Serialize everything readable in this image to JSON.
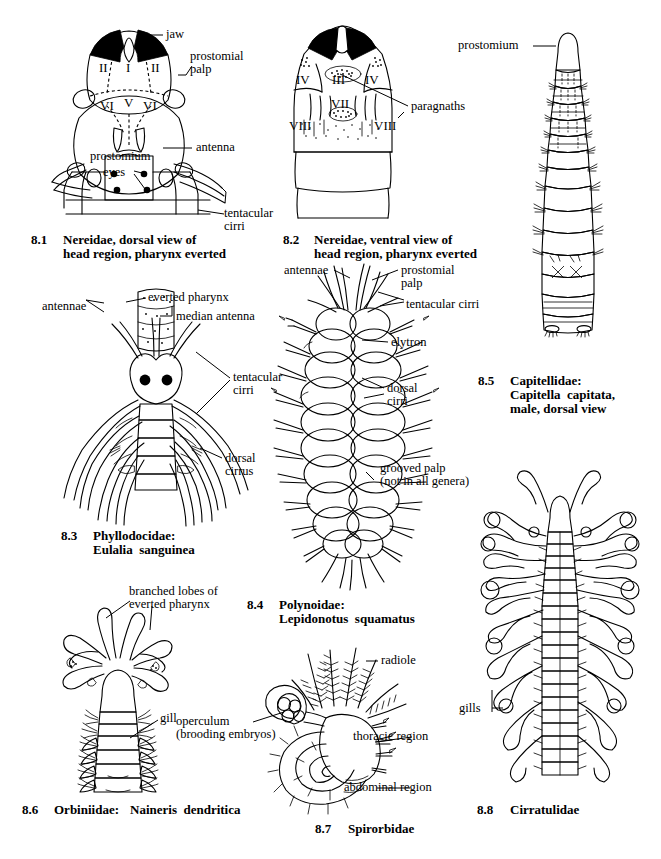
{
  "page": {
    "header_faint": "",
    "width": 661,
    "height": 859,
    "background": "#ffffff",
    "ink": "#000000"
  },
  "figures": [
    {
      "id": "8.1",
      "number": "8.1",
      "caption_line1": "Nereidae, dorsal view of",
      "caption_line2": "head region, pharynx everted",
      "taxon": "Nereidae",
      "italic_name": "",
      "labels": [
        {
          "name": "jaw",
          "text": "jaw"
        },
        {
          "name": "prostomial-palp",
          "text": "prostomial\npalp"
        },
        {
          "name": "antenna",
          "text": "antenna"
        },
        {
          "name": "prostomium",
          "text": "prostomium"
        },
        {
          "name": "eyes",
          "text": "eyes"
        },
        {
          "name": "tentacular-cirri",
          "text": "tentacular\ncirri"
        }
      ],
      "region_numerals": [
        "II",
        "I",
        "II",
        "VI",
        "V",
        "VI"
      ]
    },
    {
      "id": "8.2",
      "number": "8.2",
      "caption_line1": "Nereidae, ventral view of",
      "caption_line2": "head region, pharynx everted",
      "taxon": "Nereidae",
      "italic_name": "",
      "labels": [
        {
          "name": "paragnaths",
          "text": "paragnaths"
        }
      ],
      "region_numerals": [
        "IV",
        "III",
        "IV",
        "VII",
        "VIII",
        "VIII"
      ]
    },
    {
      "id": "8.3",
      "number": "8.3",
      "caption_line1": "Phyllodocidae:",
      "caption_line2": "Eulalia sanguinea",
      "taxon": "Phyllodocidae:",
      "italic_name": "Eulalia sanguinea",
      "labels": [
        {
          "name": "everted-pharynx",
          "text": "everted pharynx"
        },
        {
          "name": "median-antenna",
          "text": "median antenna"
        },
        {
          "name": "antennae",
          "text": "antennae"
        },
        {
          "name": "tentacular-cirri",
          "text": "tentacular\ncirri"
        },
        {
          "name": "dorsal-cirrus",
          "text": "dorsal\ncirrus"
        }
      ]
    },
    {
      "id": "8.4",
      "number": "8.4",
      "caption_line1": "Polynoidae:",
      "caption_line2": "Lepidonotus  squamatus",
      "taxon": "Polynoidae:",
      "italic_name": "Lepidonotus  squamatus",
      "labels": [
        {
          "name": "antennae",
          "text": "antennae"
        },
        {
          "name": "prostomial-palp",
          "text": "prostomial\npalp"
        },
        {
          "name": "tentacular-cirri",
          "text": "tentacular cirri"
        },
        {
          "name": "elytron",
          "text": "elytron"
        },
        {
          "name": "dorsal-cirri",
          "text": "dorsal\ncirri"
        },
        {
          "name": "grooved-palp",
          "text": "grooved palp\n(not in all genera)"
        }
      ]
    },
    {
      "id": "8.5",
      "number": "8.5",
      "caption_line1": "Capitellidae:",
      "caption_line2": "Capitella capitata,",
      "caption_line3": "male, dorsal view",
      "taxon": "Capitellidae:",
      "italic_name": "Capitella  capitata,",
      "labels": [
        {
          "name": "prostomium",
          "text": "prostomium"
        }
      ]
    },
    {
      "id": "8.6",
      "number": "8.6",
      "caption_line1": "Orbiniidae: Naineris dendritica",
      "taxon": "Orbiniidae:",
      "italic_name": "Naineris  dendritica",
      "labels": [
        {
          "name": "branched-lobes",
          "text": "branched lobes of\neverted pharynx"
        },
        {
          "name": "gill",
          "text": "gill"
        }
      ]
    },
    {
      "id": "8.7",
      "number": "8.7",
      "caption_line1": "Spirorbidae",
      "taxon": "Spirorbidae",
      "italic_name": "",
      "labels": [
        {
          "name": "radiole",
          "text": "radiole"
        },
        {
          "name": "operculum",
          "text": "operculum\n(brooding embryos)"
        },
        {
          "name": "thoracic-region",
          "text": "thoracic region"
        },
        {
          "name": "abdominal-region",
          "text": "abdominal region"
        }
      ]
    },
    {
      "id": "8.8",
      "number": "8.8",
      "caption_line1": "Cirratulidae",
      "taxon": "Cirratulidae",
      "italic_name": "",
      "labels": [
        {
          "name": "gills",
          "text": "gills"
        }
      ]
    }
  ],
  "labels_flat": {
    "f1_jaw": "jaw",
    "f1_palp_a": "prostomial",
    "f1_palp_b": "palp",
    "f1_antenna": "antenna",
    "f1_prostomium": "prostomium",
    "f1_eyes": "eyes",
    "f1_tent_a": "tentacular",
    "f1_tent_b": "cirri",
    "f1_n_II_l": "II",
    "f1_n_I": "I",
    "f1_n_II_r": "II",
    "f1_n_VI_l": "VI",
    "f1_n_V": "V",
    "f1_n_VI_r": "VI",
    "f2_paragnaths": "paragnaths",
    "f2_n_IV_l": "IV",
    "f2_n_III": "III",
    "f2_n_IV_r": "IV",
    "f2_n_VII": "VII",
    "f2_n_VIII_l": "VIII",
    "f2_n_VIII_r": "VIII",
    "f3_everted": "everted pharynx",
    "f3_median": "median antenna",
    "f3_antennae": "antennae",
    "f3_tent_a": "tentacular",
    "f3_tent_b": "cirri",
    "f3_dorsal_a": "dorsal",
    "f3_dorsal_b": "cirrus",
    "f4_antennae": "antennae",
    "f4_palp_a": "prostomial",
    "f4_palp_b": "palp",
    "f4_tent": "tentacular cirri",
    "f4_elytron": "elytron",
    "f4_dorsal_a": "dorsal",
    "f4_dorsal_b": "cirri",
    "f4_grooved_a": "grooved palp",
    "f4_grooved_b": "(not in all genera)",
    "f5_prostomium": "prostomium",
    "f6_lobes_a": "branched lobes of",
    "f6_lobes_b": "everted pharynx",
    "f6_gill": "gill",
    "f7_radiole": "radiole",
    "f7_operc_a": "operculum",
    "f7_operc_b": "(brooding embryos)",
    "f7_thoracic": "thoracic region",
    "f7_abdominal": "abdominal region",
    "f8_gills": "gills"
  },
  "captions": {
    "c1_num": "8.1",
    "c1_l1": "Nereidae, dorsal view of",
    "c1_l2": "head region, pharynx everted",
    "c2_num": "8.2",
    "c2_l1": "Nereidae, ventral view of",
    "c2_l2": "head region, pharynx everted",
    "c3_num": "8.3",
    "c3_l1": "Phyllodocidae:",
    "c3_l2": "Eulalia  sanguinea",
    "c4_num": "8.4",
    "c4_l1": "Polynoidae:",
    "c4_l2": "Lepidonotus  squamatus",
    "c5_num": "8.5",
    "c5_l1": "Capitellidae:",
    "c5_l2": "Capitella  capitata,",
    "c5_l3": "male, dorsal view",
    "c6_num": "8.6",
    "c6_l1": "Orbiniidae: ",
    "c6_l2": "Naineris  dendritica",
    "c7_num": "8.7",
    "c7_l1": "Spirorbidae",
    "c8_num": "8.8",
    "c8_l1": "Cirratulidae"
  }
}
